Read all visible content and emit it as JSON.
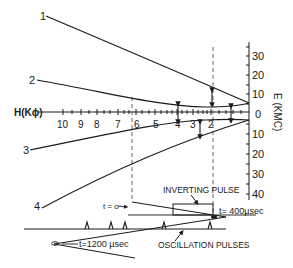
{
  "curves": {
    "c1": "1",
    "c2": "2",
    "c3": "3",
    "c4": "4"
  },
  "h_axis": {
    "label": "H(Kϕ)",
    "ticks": [
      {
        "x": 63,
        "label": "10"
      },
      {
        "x": 81,
        "label": "9"
      },
      {
        "x": 97,
        "label": "8"
      },
      {
        "x": 118,
        "label": "7"
      },
      {
        "x": 136,
        "label": "6"
      },
      {
        "x": 155,
        "label": "5"
      },
      {
        "x": 177,
        "label": "4"
      },
      {
        "x": 193,
        "label": "3"
      },
      {
        "x": 211,
        "label": "2"
      }
    ]
  },
  "e_axis": {
    "label": "E (KMC)",
    "ticks": [
      {
        "y": 56,
        "label": "30"
      },
      {
        "y": 75,
        "label": "20"
      },
      {
        "y": 94,
        "label": "10"
      },
      {
        "y": 114,
        "label": "0"
      },
      {
        "y": 134,
        "label": "10"
      },
      {
        "y": 154,
        "label": "20"
      },
      {
        "y": 174,
        "label": "30"
      },
      {
        "y": 194,
        "label": "40"
      }
    ]
  },
  "annotations": {
    "t0": "t = o",
    "t400": "t= 400µsec",
    "t1200": "t=1200 µsec",
    "inverting_pulse": "INVERTING PULSE",
    "oscillation_pulses": "OSCILLATION PULSES"
  },
  "colors": {
    "ink": "#1a1a1a",
    "background": "#ffffff"
  }
}
